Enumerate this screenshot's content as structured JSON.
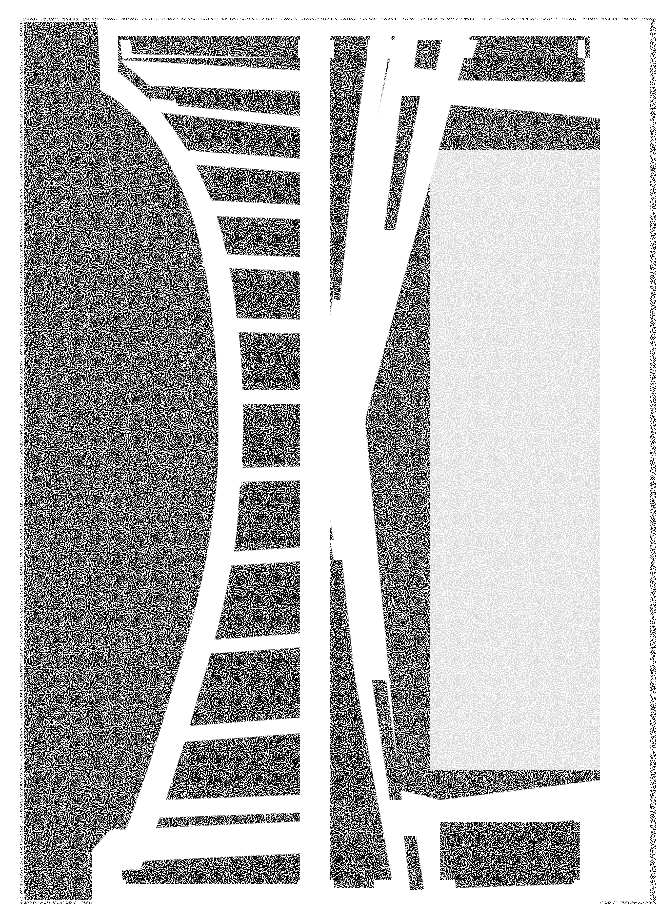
{
  "artwork": {
    "style": "stipple-drawing",
    "subject": "abstract truss / ladder structure forming an X inside a rectangular frame",
    "colors": {
      "paper": "#ffffff",
      "ink": "#3a3a3a",
      "stipple_dark": "#6e6e6e",
      "stipple_light": "#b5b5b5"
    },
    "frame": {
      "x": 20,
      "y": 18,
      "width": 636,
      "height": 886
    },
    "ladder_rungs_left": 11,
    "panels_top": 4,
    "panels_bottom": 4
  }
}
